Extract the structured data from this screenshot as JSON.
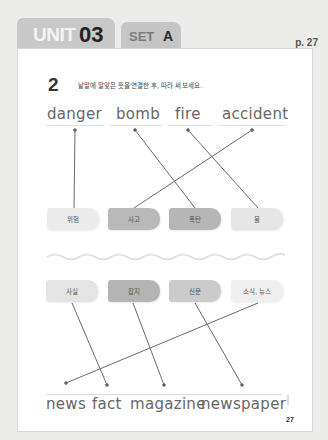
{
  "header": {
    "unit_label": "UNIT",
    "unit_number": "03",
    "set_label": "SET",
    "set_letter": "A",
    "page_ref": "p. 27"
  },
  "exercise": {
    "number": "2",
    "instruction": "낱말에 알맞은 뜻을 연결한 후, 따라 써 보세요."
  },
  "top_words": [
    "danger",
    "bomb",
    "fire",
    "accident"
  ],
  "top_meanings": [
    "위험",
    "사고",
    "폭탄",
    "불"
  ],
  "bottom_meanings": [
    "사실",
    "잡지",
    "신문",
    "소식, 뉴스"
  ],
  "bottom_words": [
    "news",
    "fact",
    "magazine",
    "newspaper"
  ],
  "matches_top": [
    {
      "word": "danger",
      "meaning": "위험"
    },
    {
      "word": "bomb",
      "meaning": "폭탄"
    },
    {
      "word": "fire",
      "meaning": "불"
    },
    {
      "word": "accident",
      "meaning": "사고"
    }
  ],
  "matches_bottom": [
    {
      "meaning": "사실",
      "word": "fact"
    },
    {
      "meaning": "잡지",
      "word": "magazine"
    },
    {
      "meaning": "신문",
      "word": "newspaper"
    },
    {
      "meaning": "소식, 뉴스",
      "word": "news"
    }
  ],
  "footer": {
    "page_number": "27"
  },
  "colors": {
    "box_light": "#ececec",
    "box_dark": "#b9b9b9",
    "box_mid": "#c9c9c9",
    "box_pale": "#e6e6e6",
    "line": "#6a6a6a"
  }
}
